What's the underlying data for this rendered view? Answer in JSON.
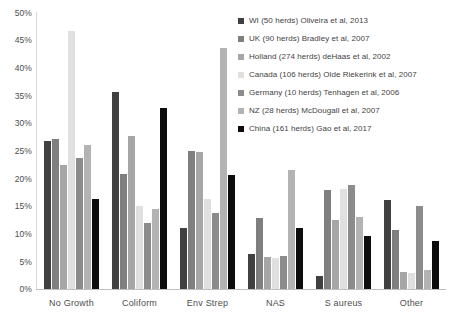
{
  "chart_data": {
    "type": "bar",
    "title": "",
    "subtitle": "",
    "xlabel": "",
    "ylabel": "",
    "ylim": [
      0,
      50
    ],
    "y_tick_labels": [
      "0%",
      "5%",
      "10%",
      "15%",
      "20%",
      "25%",
      "30%",
      "35%",
      "40%",
      "45%",
      "50%"
    ],
    "y_tick_values": [
      0,
      5,
      10,
      15,
      20,
      25,
      30,
      35,
      40,
      45,
      50
    ],
    "grid": false,
    "legend_position": "top-right",
    "categories": [
      "No Growth",
      "Coliform",
      "Env  Strep",
      "NAS",
      "S aureus",
      "Other"
    ],
    "series": [
      {
        "name": "WI (50 herds) Oliveira et al, 2013",
        "color": "#404040",
        "values": [
          26.8,
          35.6,
          11.0,
          6.4,
          2.4,
          16.0
        ]
      },
      {
        "name": "UK (90 herds) Bradley et al, 2007",
        "color": "#7f7f7f",
        "values": [
          27.0,
          20.7,
          25.0,
          12.8,
          17.9,
          10.7
        ]
      },
      {
        "name": "Holland (274 herds)  deHaas et al, 2002",
        "color": "#a6a6a6",
        "values": [
          22.3,
          27.7,
          24.8,
          5.8,
          12.5,
          3.0
        ]
      },
      {
        "name": "Canada (106 herds) Olde Riekerink et al, 2007",
        "color": "#e0e0e0",
        "values": [
          46.5,
          14.9,
          16.2,
          5.6,
          18.0,
          2.9
        ]
      },
      {
        "name": "Germany (10 herds) Tenhagen et al, 2006",
        "color": "#8c8c8c",
        "values": [
          23.7,
          11.9,
          13.7,
          6.0,
          18.8,
          15.0
        ]
      },
      {
        "name": "NZ (28 herds)  McDougall et al, 2007",
        "color": "#b3b3b3",
        "values": [
          26.0,
          14.4,
          43.5,
          21.5,
          13.0,
          3.5
        ]
      },
      {
        "name": "China (161 herds) Gao et al, 2017",
        "color": "#0d0d0d",
        "values": [
          16.2,
          32.7,
          20.6,
          11.0,
          9.6,
          8.6
        ]
      }
    ]
  }
}
